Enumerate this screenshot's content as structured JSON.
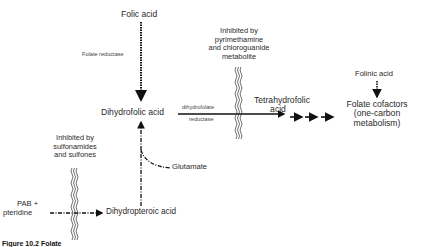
{
  "nodes": {
    "folic_acid": "Folic acid",
    "dihydrofolic_acid": "Dihydrofolic acid",
    "tetrahydrofolic_acid_line1": "Tetrahydrofolic",
    "tetrahydrofolic_acid_line2": "acid",
    "folinic_acid": "Folinic acid",
    "folate_cofactors_line1": "Folate cofactors",
    "folate_cofactors_line2": "(one-carbon",
    "folate_cofactors_line3": "metabolism)",
    "glutamate": "Glutamate",
    "pab_line1": "PAB +",
    "pab_line2": "pteridine",
    "dihydropteroic_acid": "Dihydropteroic acid"
  },
  "enzymes": {
    "folate_reductase": "Folate reductase",
    "dhfr_line1": "dihydrofolate",
    "dhfr_line2": "reductase"
  },
  "inhibitions": {
    "dhfr_block": {
      "line1": "Inhibited by",
      "line2": "pyrimethamine",
      "line3": "and chloroguanide",
      "line4": "metabolite"
    },
    "dhps_block": {
      "line1": "Inhibited by",
      "line2": "sulfonamides",
      "line3": "and sulfones"
    }
  },
  "caption": "Figure 10.2  Folate"
}
